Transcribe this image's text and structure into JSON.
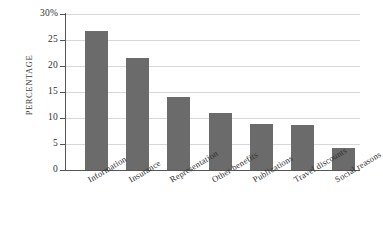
{
  "chart_data": {
    "type": "bar",
    "title": "",
    "subtitle": "",
    "xlabel": "",
    "ylabel": "PERCENTAGE",
    "categories": [
      "Information",
      "Insurance",
      "Representation",
      "Other benefits",
      "Publications",
      "Travel discounts",
      "Social reasons"
    ],
    "values": [
      26.7,
      21.6,
      14.1,
      11.0,
      8.9,
      8.6,
      4.3
    ],
    "ylim": [
      0,
      30
    ],
    "yticks": [
      0,
      5,
      10,
      15,
      20,
      25,
      30
    ],
    "ytick_labels": [
      "0",
      "5",
      "10",
      "15",
      "20",
      "25",
      "30%"
    ],
    "grid": true,
    "legend": false,
    "legend_position": "none",
    "bar_color": "#6b6b6b",
    "gridline_color": "#d8d8d8",
    "axis_color": "#555555",
    "background_color": "#ffffff"
  }
}
